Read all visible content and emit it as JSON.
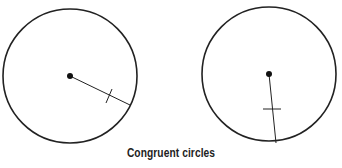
{
  "caption": "Congruent circles",
  "colors": {
    "stroke": "#222222",
    "background": "#ffffff"
  },
  "circles": [
    {
      "name": "left",
      "cx": 70,
      "cy": 76,
      "r": 67,
      "radius_end": [
        130,
        105
      ],
      "tick": [
        [
          106,
          103
        ],
        [
          111,
          89
        ]
      ]
    },
    {
      "name": "right",
      "cx": 269,
      "cy": 74,
      "r": 67,
      "radius_end": [
        276,
        143
      ],
      "tick": [
        [
          263,
          109
        ],
        [
          281,
          109
        ]
      ]
    }
  ]
}
